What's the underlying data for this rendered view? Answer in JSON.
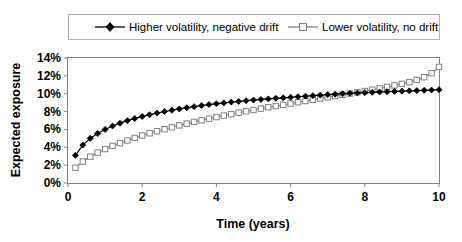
{
  "chart_data": {
    "type": "line",
    "title": "",
    "xlabel": "Time (years)",
    "ylabel": "Expected exposure",
    "xlim": [
      0,
      10
    ],
    "ylim": [
      0,
      14
    ],
    "xticks": [
      "0",
      "2",
      "4",
      "6",
      "8",
      "10"
    ],
    "xtick_values": [
      0,
      2,
      4,
      6,
      8,
      10
    ],
    "yticks": [
      "0%",
      "2%",
      "4%",
      "6%",
      "8%",
      "10%",
      "12%",
      "14%"
    ],
    "ytick_values": [
      0,
      2,
      4,
      6,
      8,
      10,
      12,
      14
    ],
    "grid": false,
    "legend_position": "top",
    "x": [
      0.2,
      0.4,
      0.6,
      0.8,
      1.0,
      1.2,
      1.4,
      1.6,
      1.8,
      2.0,
      2.2,
      2.4,
      2.6,
      2.8,
      3.0,
      3.2,
      3.4,
      3.6,
      3.8,
      4.0,
      4.2,
      4.4,
      4.6,
      4.8,
      5.0,
      5.2,
      5.4,
      5.6,
      5.8,
      6.0,
      6.2,
      6.4,
      6.6,
      6.8,
      7.0,
      7.2,
      7.4,
      7.6,
      7.8,
      8.0,
      8.2,
      8.4,
      8.6,
      8.8,
      9.0,
      9.2,
      9.4,
      9.6,
      9.8,
      10.0
    ],
    "series": [
      {
        "name": "Higher volatility, negative drift",
        "color": "#000000",
        "marker": "filled-diamond",
        "values": [
          3.1,
          4.25,
          5.0,
          5.55,
          6.0,
          6.38,
          6.7,
          6.98,
          7.23,
          7.45,
          7.65,
          7.83,
          8.0,
          8.15,
          8.3,
          8.43,
          8.55,
          8.67,
          8.78,
          8.88,
          8.97,
          9.06,
          9.14,
          9.22,
          9.29,
          9.36,
          9.42,
          9.48,
          9.54,
          9.6,
          9.66,
          9.72,
          9.78,
          9.84,
          9.9,
          9.95,
          10.0,
          10.04,
          10.08,
          10.12,
          10.16,
          10.2,
          10.23,
          10.26,
          10.29,
          10.32,
          10.35,
          10.38,
          10.41,
          10.45
        ]
      },
      {
        "name": "Lower volatility, no drift",
        "color": "#808080",
        "marker": "open-square",
        "values": [
          1.7,
          2.4,
          2.95,
          3.4,
          3.8,
          4.15,
          4.47,
          4.77,
          5.05,
          5.32,
          5.57,
          5.8,
          6.02,
          6.24,
          6.45,
          6.65,
          6.84,
          7.02,
          7.2,
          7.38,
          7.55,
          7.71,
          7.87,
          8.03,
          8.18,
          8.33,
          8.48,
          8.62,
          8.76,
          8.9,
          9.04,
          9.18,
          9.32,
          9.46,
          9.6,
          9.74,
          9.88,
          10.02,
          10.16,
          10.3,
          10.45,
          10.6,
          10.76,
          10.93,
          11.1,
          11.3,
          11.55,
          11.85,
          12.3,
          13.0
        ]
      }
    ]
  },
  "legend": {
    "entries": [
      {
        "label": "Higher volatility, negative drift",
        "color": "#000000",
        "marker": "filled-diamond"
      },
      {
        "label": "Lower volatility, no drift",
        "color": "#808080",
        "marker": "open-square"
      }
    ]
  },
  "axes": {
    "y_title": "Expected exposure",
    "x_title": "Time (years)"
  }
}
